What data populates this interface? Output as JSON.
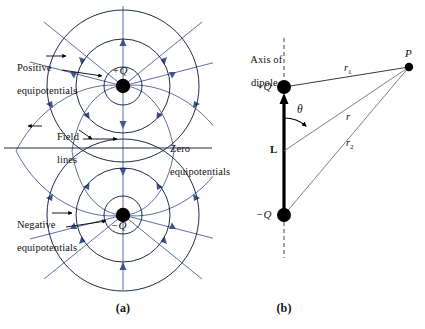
{
  "figure": {
    "panels": [
      {
        "id": "a",
        "label": "(a)",
        "caption_x": 123,
        "caption_y": 305
      },
      {
        "id": "b",
        "label": "(b)",
        "caption_x": 284,
        "caption_y": 305
      }
    ]
  },
  "colors": {
    "equipotential": "#16213f",
    "field_line": "#4a5f96",
    "charge_dot": "#000000",
    "text": "#111111",
    "leader": "#000000",
    "dashed_axis": "#555555",
    "dipole_rod": "#000000",
    "ray": "#4a4a4a"
  },
  "panel_a": {
    "name": "equipotentials-and-field-lines",
    "charges": [
      {
        "name": "positive-charge",
        "label": "+Q",
        "x": 123,
        "y": 86,
        "sign": "+"
      },
      {
        "name": "negative-charge",
        "label": "−Q",
        "x": 123,
        "y": 215,
        "sign": "−"
      }
    ],
    "annotations": [
      {
        "name": "positive-equipotentials-label",
        "line1": "Positive",
        "line2": "equipotentials",
        "x": 6,
        "y": 52
      },
      {
        "name": "field-lines-label",
        "line1": "Field",
        "line2": "lines",
        "x": 42,
        "y": 121
      },
      {
        "name": "zero-equipotentials-label",
        "line1": "Zero",
        "line2": "equipotentials",
        "x": 159,
        "y": 133
      },
      {
        "name": "negative-equipotentials-label",
        "line1": "Negative",
        "line2": "equipotentials",
        "x": 6,
        "y": 209
      }
    ],
    "zero_equipotential_line": {
      "name": "zero-equipotential-line",
      "y": 148,
      "x1": 4,
      "x2": 212
    },
    "equipotential_radii_positive": [
      19,
      47,
      76
    ],
    "equipotential_radii_negative": [
      19,
      47,
      76
    ]
  },
  "panel_b": {
    "name": "dipole-geometry",
    "axis_label": {
      "line1": "Axis of",
      "line2": "dipole",
      "x": 240,
      "y": 44
    },
    "points": [
      {
        "name": "positive-charge",
        "label": "+Q",
        "x": 284,
        "y": 87
      },
      {
        "name": "negative-charge",
        "label": "−Q",
        "x": 284,
        "y": 215
      },
      {
        "name": "field-point",
        "label": "P",
        "x": 409,
        "y": 67
      }
    ],
    "distances": [
      {
        "name": "r1-label",
        "label": "r",
        "subscript": "1",
        "x": 335,
        "y": 55
      },
      {
        "name": "r-label",
        "label": "r",
        "subscript": "",
        "x": 336,
        "y": 103
      },
      {
        "name": "r2-label",
        "label": "r",
        "subscript": "2",
        "x": 337,
        "y": 129
      }
    ],
    "angle": {
      "name": "theta-label",
      "label": "θ",
      "x": 298,
      "y": 107
    },
    "dipole_length": {
      "name": "dipole-length-label",
      "label": "L",
      "x": 272,
      "y": 146
    },
    "midpoint": {
      "x": 284,
      "y": 151
    }
  }
}
